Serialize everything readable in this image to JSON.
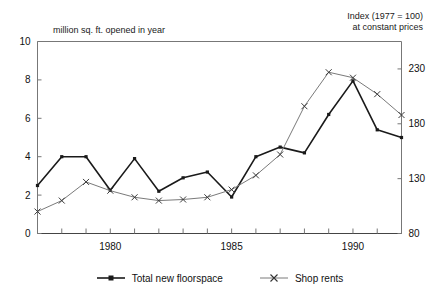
{
  "labels": {
    "left_caption": "million sq. ft. opened in year",
    "right_caption_line1": "Index (1977 = 100)",
    "right_caption_line2": "at constant prices"
  },
  "legend": {
    "items": [
      {
        "label": "Total new floorspace",
        "key": "line-square-marker",
        "color": "#1a1a1a"
      },
      {
        "label": "Shop rents",
        "key": "line-cross-marker",
        "color": "#7a7a7a"
      }
    ]
  },
  "axes": {
    "left_ticks": [
      "0",
      "2",
      "4",
      "6",
      "8",
      "10"
    ],
    "right_ticks": [
      "80",
      "130",
      "180",
      "230"
    ],
    "x_ticks": [
      "1980",
      "1985",
      "1990"
    ]
  },
  "chart_data": {
    "type": "line",
    "title": "",
    "subtitle": "",
    "xlabel": "",
    "ylabel": "million sq. ft. opened in year",
    "y2label": "Index (1977 = 100) at constant prices",
    "grid": false,
    "legend_position": "bottom",
    "x": [
      1977,
      1978,
      1979,
      1980,
      1981,
      1982,
      1983,
      1984,
      1985,
      1986,
      1987,
      1988,
      1989,
      1990,
      1991,
      1992
    ],
    "xlim": [
      1977,
      1992
    ],
    "xticks": [
      1980,
      1985,
      1990
    ],
    "xticklabels": [
      "1980",
      "1985",
      "1990"
    ],
    "ylim": [
      0,
      10
    ],
    "yticks": [
      0,
      2,
      4,
      6,
      8,
      10
    ],
    "yticklabels": [
      "0",
      "2",
      "4",
      "6",
      "8",
      "10"
    ],
    "y2lim": [
      80,
      255
    ],
    "y2ticks": [
      80,
      130,
      180,
      230
    ],
    "y2ticklabels": [
      "80",
      "130",
      "180",
      "230"
    ],
    "series": [
      {
        "name": "Total new floorspace",
        "axis": "left",
        "color": "#1a1a1a",
        "marker": "square",
        "values": [
          2.5,
          4.0,
          4.0,
          2.25,
          3.9,
          2.2,
          2.9,
          3.2,
          1.9,
          4.0,
          4.5,
          4.2,
          6.2,
          7.95,
          5.4,
          5.0
        ]
      },
      {
        "name": "Shop rents",
        "axis": "right",
        "color": "#7a7a7a",
        "marker": "cross",
        "values": [
          100,
          110,
          127,
          119,
          113,
          110,
          111,
          113,
          120,
          133,
          152,
          196,
          227,
          222,
          207,
          188
        ]
      }
    ]
  }
}
